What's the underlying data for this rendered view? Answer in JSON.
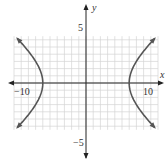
{
  "chart_data": {
    "type": "line",
    "title": "",
    "xlabel": "x",
    "ylabel": "y",
    "xlim": [
      -10,
      10
    ],
    "ylim": [
      -6.5,
      6.5
    ],
    "grid": true,
    "grid_step": 1,
    "x_tick_labels": [
      {
        "value": -10,
        "label": "−10"
      },
      {
        "value": 10,
        "label": "10"
      }
    ],
    "y_tick_labels": [
      {
        "value": 5,
        "label": "5"
      },
      {
        "value": -5,
        "label": "−5"
      }
    ],
    "equation": "x^2/36 - y^2/25 = 1",
    "series": [
      {
        "name": "right branch",
        "x": [
          9.5,
          8.5,
          7.6,
          6.9,
          6.4,
          6.0,
          6.4,
          6.9,
          7.6,
          8.5,
          9.5
        ],
        "y": [
          6.2,
          5.2,
          4.0,
          2.8,
          1.6,
          0,
          -1.6,
          -2.8,
          -4.0,
          -5.2,
          -6.2
        ]
      },
      {
        "name": "left branch",
        "x": [
          -9.5,
          -8.5,
          -7.6,
          -6.9,
          -6.4,
          -6.0,
          -6.4,
          -6.9,
          -7.6,
          -8.5,
          -9.5
        ],
        "y": [
          6.2,
          5.2,
          4.0,
          2.8,
          1.6,
          0,
          -1.6,
          -2.8,
          -4.0,
          -5.2,
          -6.2
        ]
      }
    ],
    "colors": {
      "curve": "#555555",
      "grid": "#d4d4d4",
      "axis": "#222222"
    }
  }
}
